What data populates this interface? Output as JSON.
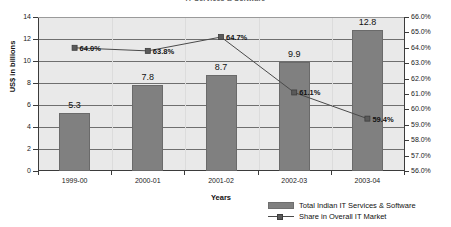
{
  "chart_data": {
    "type": "bar",
    "title": "IT Services & Software",
    "categories": [
      "1999-00",
      "2000-01",
      "2001-02",
      "2002-03",
      "2003-04"
    ],
    "xlabel": "Years",
    "ylabel": "US$ in billions",
    "ylim": [
      0,
      14
    ],
    "y_ticks": [
      "0",
      "2",
      "4",
      "6",
      "8",
      "10",
      "12",
      "14"
    ],
    "y2label": "",
    "y2lim": [
      56.0,
      66.0
    ],
    "y2_ticks": [
      "56.0%",
      "57.0%",
      "58.0%",
      "59.0%",
      "60.0%",
      "61.0%",
      "62.0%",
      "63.0%",
      "64.0%",
      "65.0%",
      "66.0%"
    ],
    "grid": true,
    "legend_position": "bottom-right",
    "series": [
      {
        "name": "Total Indian IT Services & Software",
        "type": "bar",
        "axis": "left",
        "color": "#808080",
        "values": [
          5.3,
          7.8,
          8.7,
          9.9,
          12.8
        ],
        "labels": [
          "5.3",
          "7.8",
          "8.7",
          "9.9",
          "12.8"
        ]
      },
      {
        "name": "Share in Overall IT Market",
        "type": "line",
        "axis": "right",
        "color": "#4a4a4a",
        "values": [
          64.0,
          63.8,
          64.7,
          61.1,
          59.4
        ],
        "labels": [
          "64.0%",
          "63.8%",
          "64.7%",
          "61.1%",
          "59.4%"
        ]
      }
    ]
  }
}
